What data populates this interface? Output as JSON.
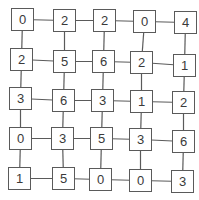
{
  "diagram": {
    "type": "grid-graph",
    "rows": 5,
    "cols": 5,
    "line_color": "#5a5a5a",
    "box_border_color": "#5a5a5a",
    "text_color": "#3a3a3a",
    "values": [
      [
        0,
        2,
        2,
        0,
        4
      ],
      [
        2,
        5,
        6,
        2,
        1
      ],
      [
        3,
        6,
        3,
        1,
        2
      ],
      [
        0,
        3,
        5,
        3,
        6
      ],
      [
        1,
        5,
        0,
        0,
        3
      ]
    ],
    "nodes": [
      {
        "r": 0,
        "c": 0,
        "label": "0",
        "x": 11,
        "y": 8
      },
      {
        "r": 0,
        "c": 1,
        "label": "2",
        "x": 53,
        "y": 9
      },
      {
        "r": 0,
        "c": 2,
        "label": "2",
        "x": 93,
        "y": 9
      },
      {
        "r": 0,
        "c": 3,
        "label": "0",
        "x": 133,
        "y": 10
      },
      {
        "r": 0,
        "c": 4,
        "label": "4",
        "x": 174,
        "y": 11
      },
      {
        "r": 1,
        "c": 0,
        "label": "2",
        "x": 10,
        "y": 48
      },
      {
        "r": 1,
        "c": 1,
        "label": "5",
        "x": 53,
        "y": 50
      },
      {
        "r": 1,
        "c": 2,
        "label": "6",
        "x": 92,
        "y": 50
      },
      {
        "r": 1,
        "c": 3,
        "label": "2",
        "x": 130,
        "y": 51
      },
      {
        "r": 1,
        "c": 4,
        "label": "1",
        "x": 173,
        "y": 54
      },
      {
        "r": 2,
        "c": 0,
        "label": "3",
        "x": 9,
        "y": 87
      },
      {
        "r": 2,
        "c": 1,
        "label": "6",
        "x": 52,
        "y": 89
      },
      {
        "r": 2,
        "c": 2,
        "label": "3",
        "x": 91,
        "y": 89
      },
      {
        "r": 2,
        "c": 3,
        "label": "1",
        "x": 130,
        "y": 90
      },
      {
        "r": 2,
        "c": 4,
        "label": "2",
        "x": 172,
        "y": 91
      },
      {
        "r": 3,
        "c": 0,
        "label": "0",
        "x": 9,
        "y": 127
      },
      {
        "r": 3,
        "c": 1,
        "label": "3",
        "x": 51,
        "y": 127
      },
      {
        "r": 3,
        "c": 2,
        "label": "5",
        "x": 90,
        "y": 127
      },
      {
        "r": 3,
        "c": 3,
        "label": "3",
        "x": 129,
        "y": 128
      },
      {
        "r": 3,
        "c": 4,
        "label": "6",
        "x": 172,
        "y": 130
      },
      {
        "r": 4,
        "c": 0,
        "label": "1",
        "x": 8,
        "y": 167
      },
      {
        "r": 4,
        "c": 1,
        "label": "5",
        "x": 52,
        "y": 167
      },
      {
        "r": 4,
        "c": 2,
        "label": "0",
        "x": 89,
        "y": 168
      },
      {
        "r": 4,
        "c": 3,
        "label": "0",
        "x": 129,
        "y": 169
      },
      {
        "r": 4,
        "c": 4,
        "label": "3",
        "x": 171,
        "y": 170
      }
    ]
  }
}
